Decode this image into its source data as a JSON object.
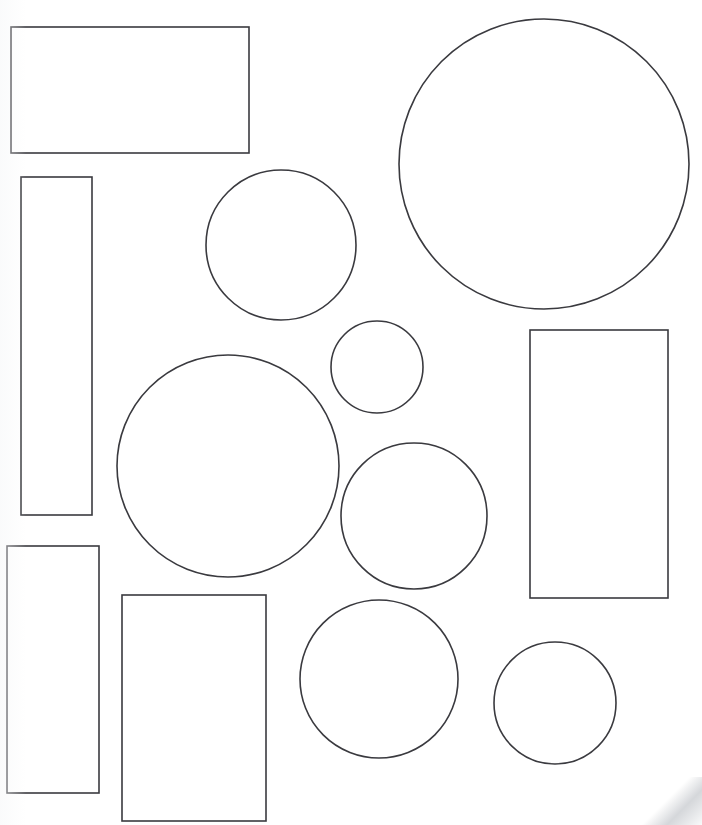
{
  "document": {
    "title": "Geometric Shapes Worksheet",
    "page_width": 702,
    "page_height": 825,
    "background_color": "#ffffff",
    "stroke_color": "#3a3a3f",
    "fill_color": "#ffffff",
    "stroke_width": 1.6,
    "shape_count": 13,
    "rectangle_count": 6,
    "circle_count": 7
  },
  "shapes": [
    {
      "id": "rect-top-left-wide",
      "type": "rectangle",
      "label": "Wide rectangle",
      "x": 11,
      "y": 27,
      "width": 238,
      "height": 126
    },
    {
      "id": "rect-left-tall-narrow",
      "type": "rectangle",
      "label": "Tall narrow rectangle",
      "x": 21,
      "y": 177,
      "width": 71,
      "height": 338
    },
    {
      "id": "rect-bottom-left",
      "type": "rectangle",
      "label": "Bottom left rectangle",
      "x": 7,
      "y": 546,
      "width": 92,
      "height": 247
    },
    {
      "id": "rect-bottom-center",
      "type": "rectangle",
      "label": "Bottom center rectangle",
      "x": 122,
      "y": 595,
      "width": 144,
      "height": 226
    },
    {
      "id": "rect-right-tall",
      "type": "rectangle",
      "label": "Right tall rectangle",
      "x": 530,
      "y": 330,
      "width": 138,
      "height": 268
    },
    {
      "id": "circle-top-right-large",
      "type": "circle",
      "label": "Large circle",
      "cx": 544,
      "cy": 164,
      "r": 145
    },
    {
      "id": "circle-top-center-medium",
      "type": "circle",
      "label": "Medium circle top center",
      "cx": 281,
      "cy": 245,
      "r": 75
    },
    {
      "id": "circle-center-small",
      "type": "circle",
      "label": "Small circle",
      "cx": 377,
      "cy": 367,
      "r": 46
    },
    {
      "id": "circle-left-large",
      "type": "circle",
      "label": "Large circle left middle",
      "cx": 228,
      "cy": 466,
      "r": 111
    },
    {
      "id": "circle-center-right-medium",
      "type": "circle",
      "label": "Medium circle center right",
      "cx": 414,
      "cy": 516,
      "r": 73
    },
    {
      "id": "circle-bottom-center",
      "type": "circle",
      "label": "Circle bottom center",
      "cx": 379,
      "cy": 679,
      "r": 79
    },
    {
      "id": "circle-bottom-right",
      "type": "circle",
      "label": "Small circle bottom right",
      "cx": 555,
      "cy": 703,
      "r": 61
    }
  ]
}
